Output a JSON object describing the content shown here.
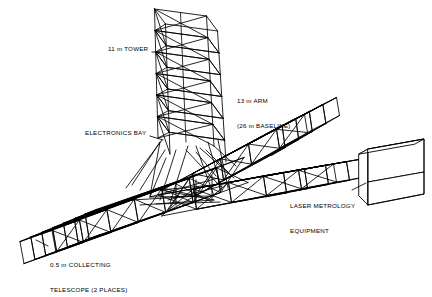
{
  "figure": {
    "type": "engineering-line-drawing",
    "background_color": "#ffffff",
    "line_color": "#000000",
    "fill_color": "#ffffff"
  },
  "labels": {
    "tower": {
      "text": "11 m TOWER",
      "x": 108,
      "y": 49
    },
    "arm": {
      "line1": "13 m ARM",
      "line2": "(26 m BASELINE)",
      "x": 237,
      "y": 85
    },
    "electronics_bay": {
      "text": "ELECTRONICS BAY",
      "x": 85,
      "y": 133
    },
    "laser_metrology": {
      "line1": "LASER METROLOGY",
      "line2": "EQUIPMENT",
      "x": 290,
      "y": 190
    },
    "collecting_telescope": {
      "line1": "0.5 m COLLECTING",
      "line2": "TELESCOPE (2 PLACES)",
      "x": 50,
      "y": 249
    }
  },
  "components": [
    {
      "name": "tower",
      "description": "11 m vertical square-section X-braced truss tower",
      "bays": 6
    },
    {
      "name": "upper-right-arm",
      "description": "13 m arm rising to the upper right, X-braced truss",
      "bays": 5
    },
    {
      "name": "lower-right-arm",
      "description": "Arm extending to the lower right terminating at laser metrology equipment box",
      "bays": 5
    },
    {
      "name": "left-boom",
      "description": "Long boom to the lower left carrying the 0.5 m collecting telescope",
      "bays": 7
    },
    {
      "name": "laser-metrology-box",
      "description": "Solid rectangular equipment box at end of lower-right arm"
    }
  ]
}
